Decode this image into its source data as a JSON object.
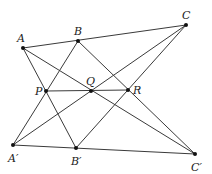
{
  "colors": {
    "line": "#3a3a3a",
    "point": "#111111",
    "label": "#222222",
    "background": "#ffffff"
  },
  "points": [
    {
      "id": "A",
      "label": "A",
      "x": 23,
      "y": 48,
      "lx": 17,
      "ly": 42
    },
    {
      "id": "B",
      "label": "B",
      "x": 78,
      "y": 41,
      "lx": 74,
      "ly": 35
    },
    {
      "id": "C",
      "label": "C",
      "x": 186,
      "y": 25,
      "lx": 182,
      "ly": 19
    },
    {
      "id": "P",
      "label": "P",
      "x": 46,
      "y": 91,
      "lx": 35,
      "ly": 95
    },
    {
      "id": "Q",
      "label": "Q",
      "x": 91,
      "y": 91,
      "lx": 86,
      "ly": 85
    },
    {
      "id": "R",
      "label": "R",
      "x": 128,
      "y": 90,
      "lx": 133,
      "ly": 94
    },
    {
      "id": "A2",
      "label": "A′",
      "x": 13,
      "y": 145,
      "lx": 8,
      "ly": 162
    },
    {
      "id": "B2",
      "label": "B′",
      "x": 76,
      "y": 148,
      "lx": 71,
      "ly": 165
    },
    {
      "id": "C2",
      "label": "C′",
      "x": 195,
      "y": 154,
      "lx": 191,
      "ly": 171
    }
  ],
  "segments": [
    {
      "name": "line-abc",
      "from": "A",
      "to": "C"
    },
    {
      "name": "line-a2b2c2",
      "from": "A2",
      "to": "C2"
    },
    {
      "name": "line-a-b2",
      "from": "A",
      "to": "B2"
    },
    {
      "name": "line-a2-b",
      "from": "A2",
      "to": "B"
    },
    {
      "name": "line-a-c2",
      "from": "A",
      "to": "C2"
    },
    {
      "name": "line-a2-c",
      "from": "A2",
      "to": "C"
    },
    {
      "name": "line-b-c2",
      "from": "B",
      "to": "C2"
    },
    {
      "name": "line-b2-c",
      "from": "B2",
      "to": "C"
    },
    {
      "name": "line-pqr",
      "from": "P",
      "to": "R"
    }
  ]
}
